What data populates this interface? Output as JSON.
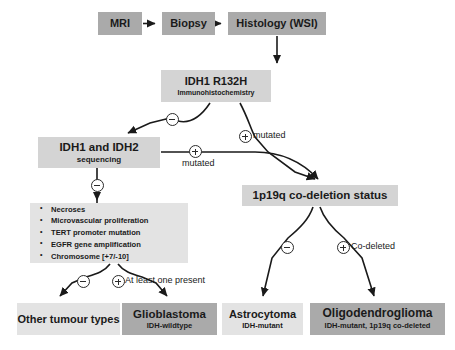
{
  "diagram": {
    "background_color": "#ffffff",
    "colors": {
      "box_dark": "#aaaaaa",
      "box_mid": "#b8b8b8",
      "box_light": "#d4d4d4",
      "box_pale": "#e3e3e3",
      "stroke": "#1a1a1a",
      "text": "#1a1a1a"
    }
  },
  "nodes": {
    "mri": {
      "title": "MRI"
    },
    "biopsy": {
      "title": "Biopsy"
    },
    "histology": {
      "title": "Histology (WSI)"
    },
    "ihc": {
      "title": "IDH1 R132H",
      "subtitle": "Immunohistochemistry"
    },
    "idh_sequencing": {
      "title": "IDH1 and IDH2",
      "subtitle": "sequencing"
    },
    "codeletion": {
      "title": "1p19q co-deletion status"
    },
    "features": {
      "items": [
        "Necroses",
        "Microvascular proliferation",
        "TERT promoter mutation",
        "EGFR gene amplification",
        "Chromosome [+7/-10]"
      ]
    },
    "other_tumour": {
      "title": "Other tumour types"
    },
    "glioblastoma": {
      "title": "Glioblastoma",
      "subtitle": "IDH-wildtype"
    },
    "astrocytoma": {
      "title": "Astrocytoma",
      "subtitle": "IDH-mutant"
    },
    "oligodendroglioma": {
      "title": "Oligodendroglioma",
      "subtitle": "IDH-mutant, 1p19q co-deleted"
    }
  },
  "edge_labels": {
    "ihc_negative_sign": "minus",
    "ihc_positive_sign": "plus",
    "ihc_positive_text": "mutated",
    "idh_negative_sign": "minus",
    "idh_positive_sign": "plus",
    "idh_positive_text": "mutated",
    "features_negative_sign": "minus",
    "features_positive_sign": "plus",
    "features_positive_text": "At least one present",
    "codeletion_negative_sign": "minus",
    "codeletion_positive_sign": "plus",
    "codeletion_positive_text": "Co-deleted"
  }
}
